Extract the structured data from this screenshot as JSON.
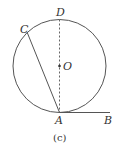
{
  "figure": {
    "caption": "(c)",
    "points": {
      "A": "A",
      "B": "B",
      "C": "C",
      "D": "D",
      "O": "O"
    },
    "elements": [
      {
        "type": "circle",
        "center": "O"
      },
      {
        "type": "chord",
        "from": "A",
        "to": "C",
        "style": "solid"
      },
      {
        "type": "diameter",
        "from": "A",
        "to": "D",
        "style": "dashed"
      },
      {
        "type": "tangent",
        "from": "A",
        "to": "B",
        "style": "solid"
      }
    ],
    "colors": {
      "stroke": "#555555",
      "text": "#333333",
      "background": "#ffffff"
    }
  }
}
